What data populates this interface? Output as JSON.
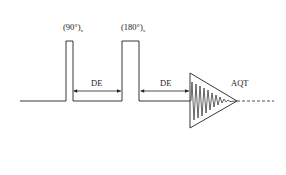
{
  "diagram": {
    "title": "",
    "pulse_90": {
      "label": "(90°)",
      "subscript": "x"
    },
    "pulse_180": {
      "label": "(180°)",
      "subscript": "x"
    },
    "delay_1": {
      "label": "DE"
    },
    "delay_2": {
      "label": "DE"
    },
    "acquisition": {
      "label": "AQT"
    },
    "colors": {
      "stroke": "#222222",
      "background": "#ffffff"
    }
  }
}
